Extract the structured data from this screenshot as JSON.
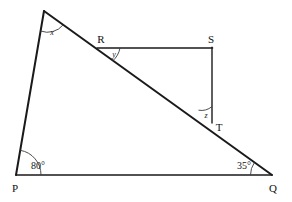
{
  "figure": {
    "type": "geometry-diagram",
    "background_color": "#ffffff",
    "stroke_color": "#1a1a1a"
  },
  "points": {
    "apex": {
      "label": "",
      "x": 44,
      "y": 11
    },
    "P": {
      "label": "P",
      "x": 16,
      "y": 175
    },
    "Q": {
      "label": "Q",
      "x": 272,
      "y": 175
    },
    "R": {
      "label": "R",
      "x": 97,
      "y": 48
    },
    "S": {
      "label": "S",
      "x": 212,
      "y": 48
    },
    "T": {
      "label": "T",
      "x": 212,
      "y": 123
    }
  },
  "vertex_labels": [
    {
      "name": "P",
      "text": "P",
      "x": 15,
      "y": 188
    },
    {
      "name": "Q",
      "text": "Q",
      "x": 273,
      "y": 188
    },
    {
      "name": "R",
      "text": "R",
      "x": 101,
      "y": 39
    },
    {
      "name": "S",
      "text": "S",
      "x": 211,
      "y": 39
    },
    {
      "name": "T",
      "text": "T",
      "x": 219,
      "y": 127
    }
  ],
  "angles": [
    {
      "name": "x",
      "text": "x",
      "x": 52,
      "y": 33,
      "kind": "variable",
      "at_vertex": "apex"
    },
    {
      "name": "y",
      "text": "y",
      "x": 114,
      "y": 55,
      "kind": "variable",
      "at_vertex": "R"
    },
    {
      "name": "z",
      "text": "z",
      "x": 206,
      "y": 116,
      "kind": "variable",
      "at_vertex": "T"
    },
    {
      "name": "angle-p",
      "text": "80°",
      "x": 38,
      "y": 166,
      "kind": "measure",
      "at_vertex": "P"
    },
    {
      "name": "angle-q",
      "text": "35°",
      "x": 244,
      "y": 166,
      "kind": "measure",
      "at_vertex": "Q"
    }
  ],
  "segments": [
    {
      "name": "segment-apex-P",
      "from": "apex",
      "to": "P",
      "width": 2
    },
    {
      "name": "segment-apex-Q",
      "from": "apex",
      "to": "Q",
      "width": 2
    },
    {
      "name": "segment-P-Q",
      "from": "P",
      "to": "Q",
      "width": 1.6
    },
    {
      "name": "segment-R-S",
      "from": "R",
      "to": "S",
      "width": 1.3
    },
    {
      "name": "segment-S-T",
      "from": "S",
      "to": "T",
      "width": 1.3
    }
  ]
}
